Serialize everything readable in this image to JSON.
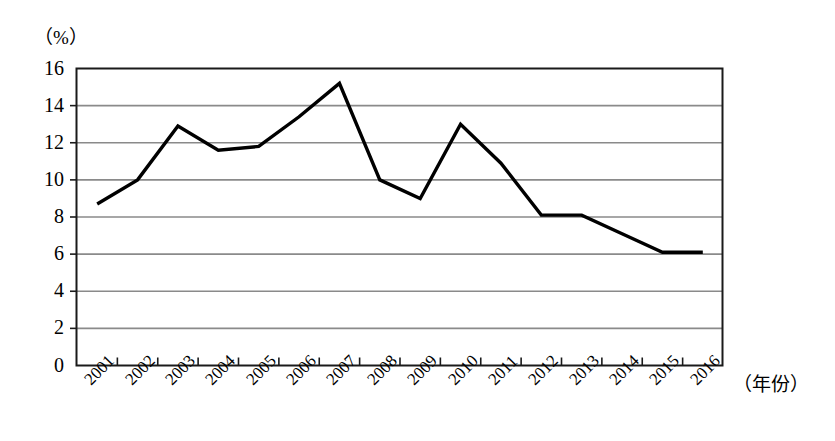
{
  "chart_data": {
    "type": "line",
    "title": "",
    "xlabel": "（年份）",
    "ylabel": "（%）",
    "categories": [
      "2001",
      "2002",
      "2003",
      "2004",
      "2005",
      "2006",
      "2007",
      "2008",
      "2009",
      "2010",
      "2011",
      "2012",
      "2013",
      "2014",
      "2015",
      "2016"
    ],
    "values": [
      8.7,
      10.0,
      12.9,
      11.6,
      11.8,
      13.4,
      15.2,
      10.0,
      9.0,
      13.0,
      10.9,
      8.1,
      8.1,
      7.1,
      6.1,
      6.1
    ],
    "series": [
      {
        "name": "",
        "values": [
          8.7,
          10.0,
          12.9,
          11.6,
          11.8,
          13.4,
          15.2,
          10.0,
          9.0,
          13.0,
          10.9,
          8.1,
          8.1,
          7.1,
          6.1,
          6.1
        ]
      }
    ],
    "ylim": [
      0,
      16
    ],
    "ytick_labels": [
      "0",
      "2",
      "4",
      "6",
      "8",
      "10",
      "12",
      "14",
      "16"
    ],
    "ytick_values": [
      0,
      2,
      4,
      6,
      8,
      10,
      12,
      14,
      16
    ],
    "grid": true,
    "grid_axis": "y",
    "legend": "none",
    "line_color": "#000000",
    "grid_color": "#8a8a8a",
    "frame_color": "#1a1a1a",
    "background_color": "#ffffff"
  },
  "axes": {
    "y_unit": "（%）",
    "x_unit": "（年份）"
  }
}
